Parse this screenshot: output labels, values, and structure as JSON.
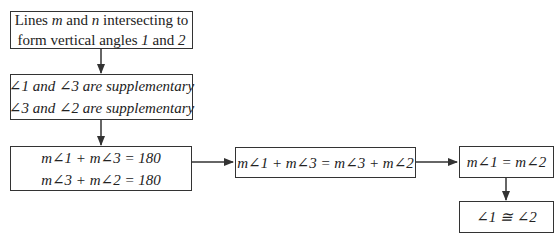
{
  "nodes": [
    {
      "id": "given",
      "lines": [
        "Lines m and n intersecting to",
        "form vertical angles 1 and 2"
      ]
    },
    {
      "id": "supp",
      "lines": [
        "∠1 and ∠3 are supplementary",
        "∠3 and ∠2 are supplementary"
      ]
    },
    {
      "id": "sums",
      "lines": [
        "m∠1 + m∠3 = 180",
        "m∠3 + m∠2 = 180"
      ]
    },
    {
      "id": "subst",
      "lines": [
        "m∠1 + m∠3 = m∠3 + m∠2"
      ]
    },
    {
      "id": "subtract",
      "lines": [
        "m∠1 = m∠2"
      ]
    },
    {
      "id": "congruent",
      "lines": [
        "∠1 ≅ ∠2"
      ]
    }
  ],
  "edges": [
    {
      "from": "given",
      "to": "supp"
    },
    {
      "from": "supp",
      "to": "sums"
    },
    {
      "from": "sums",
      "to": "subst"
    },
    {
      "from": "subst",
      "to": "subtract"
    },
    {
      "from": "subtract",
      "to": "congruent"
    }
  ]
}
